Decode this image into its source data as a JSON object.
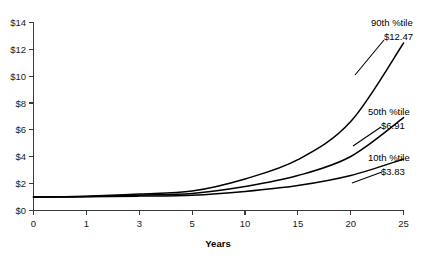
{
  "chart_data": {
    "type": "line",
    "title": "",
    "xlabel": "Years",
    "ylabel": "",
    "grid": false,
    "legend_position": "inline-annotations",
    "x": [
      0,
      1,
      3,
      5,
      10,
      15,
      20,
      25
    ],
    "x_tick_labels": [
      "0",
      "1",
      "3",
      "5",
      "10",
      "15",
      "20",
      "25"
    ],
    "y_tick_labels": [
      "$0",
      "$2",
      "$4",
      "$6",
      "$8",
      "$10",
      "$12",
      "$14"
    ],
    "y_tick_values": [
      0,
      2,
      4,
      6,
      8,
      10,
      12,
      14
    ],
    "ylim": [
      0,
      14
    ],
    "series": [
      {
        "name": "90th %tile",
        "end_label": "$12.47",
        "end_value": 12.47,
        "values": [
          1.0,
          1.06,
          1.22,
          1.45,
          2.35,
          3.78,
          6.62,
          12.47
        ]
      },
      {
        "name": "50th %tile",
        "end_label": "$6.91",
        "end_value": 6.91,
        "values": [
          1.0,
          1.04,
          1.14,
          1.27,
          1.79,
          2.6,
          4.02,
          6.91
        ]
      },
      {
        "name": "10th %tile",
        "end_label": "$3.83",
        "end_value": 3.83,
        "values": [
          1.0,
          1.02,
          1.07,
          1.14,
          1.42,
          1.86,
          2.61,
          3.83
        ]
      }
    ],
    "annotations": [
      {
        "name": "90th %tile",
        "value": "$12.47"
      },
      {
        "name": "50th %tile",
        "value": "$6.91"
      },
      {
        "name": "10th %tile",
        "value": "$3.83"
      }
    ]
  }
}
